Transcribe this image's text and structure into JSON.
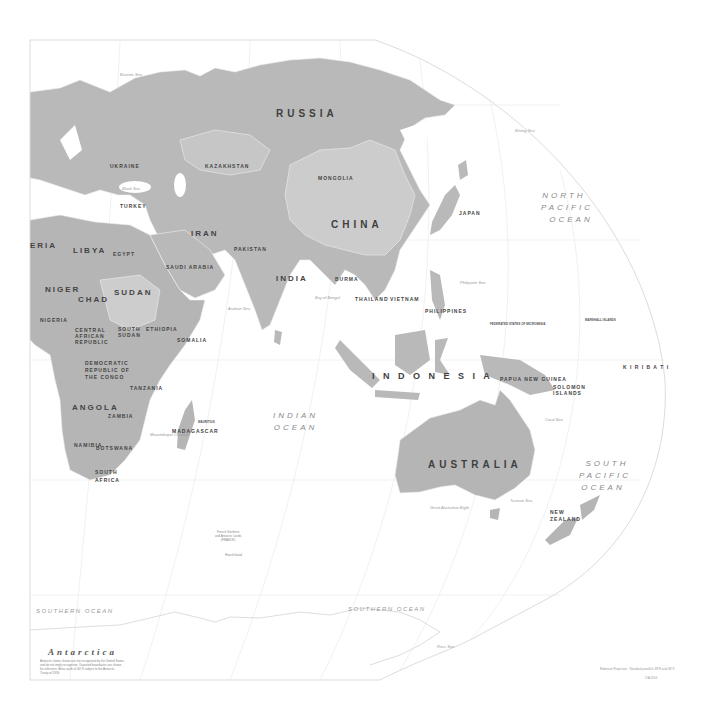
{
  "map": {
    "projection_frame": "world map, Eastern Hemisphere, pacific-centered oval edge",
    "colors": {
      "land": "#b7b7b7",
      "land_alt": "#c9c9c9",
      "land_light": "#d6d6d6",
      "water": "#ffffff",
      "graticule": "#e6e6e6",
      "border": "#ececec",
      "text": "#3a3a3a",
      "ocean_text": "#8a8a8a"
    },
    "countries": {
      "russia": "RUSSIA",
      "kazakhstan": "KAZAKHSTAN",
      "mongolia": "MONGOLIA",
      "china": "CHINA",
      "ukraine": "UKRAINE",
      "turkey": "TURKEY",
      "iran": "IRAN",
      "libya": "LIBYA",
      "egypt": "EGYPT",
      "saudi_arabia": "SAUDI ARABIA",
      "algeria": "ERIA",
      "niger": "NIGER",
      "chad": "CHAD",
      "sudan": "SUDAN",
      "nigeria": "NIGERIA",
      "south_sudan": "SOUTH SUDAN",
      "ethiopia": "ETHIOPIA",
      "somalia": "SOMALIA",
      "car": "CENTRAL AFRICAN REPUBLIC",
      "drc": "DEMOCRATIC REPUBLIC OF THE CONGO",
      "tanzania": "TANZANIA",
      "angola": "ANGOLA",
      "zambia": "ZAMBIA",
      "namibia": "NAMIBIA",
      "botswana": "BOTSWANA",
      "south_africa": "SOUTH AFRICA",
      "madagascar": "MADAGASCAR",
      "india": "INDIA",
      "pakistan": "PAKISTAN",
      "burma": "BURMA",
      "thailand": "THAILAND",
      "vietnam": "VIETNAM",
      "philippines": "PHILIPPINES",
      "indonesia": "I N D O N E S I A",
      "papua_new_guinea": "PAPUA NEW GUINEA",
      "australia": "AUSTRALIA",
      "new_zealand": "NEW ZEALAND",
      "japan": "JAPAN",
      "solomon_islands": "SOLOMON ISLANDS",
      "kiribati": "K I R I B A T I"
    },
    "oceans": {
      "north_pacific": [
        "NORTH",
        "PACIFIC",
        "OCEAN"
      ],
      "south_pacific": [
        "SOUTH",
        "PACIFIC",
        "OCEAN"
      ],
      "indian": [
        "INDIAN",
        "OCEAN"
      ],
      "southern_left": "SOUTHERN OCEAN",
      "southern_right": "SOUTHERN OCEAN"
    },
    "seas": {
      "arabian_sea": "Arabian Sea",
      "bay_of_bengal": "Bay of Bengal",
      "philippine_sea": "Philippine Sea",
      "tasman_sea": "Tasman Sea",
      "black_sea": "Black Sea",
      "barents_sea": "Barents Sea",
      "bering_sea": "Bering Sea",
      "great_australian_bight": "Great Australian Bight",
      "ross_sea": "Ross Sea",
      "coral_sea": "Coral Sea",
      "mozambique_channel": "Mozambique Channel"
    },
    "islands": {
      "french_southern": [
        "French Southern",
        "and Antarctic Lands",
        "(FRANCE)"
      ],
      "heard": "Heard Island",
      "mauritius": "MAURITIUS",
      "micronesia": "FEDERATED STATES OF MICRONESIA",
      "marshall": "MARSHALL ISLANDS"
    },
    "antarctica": {
      "title": "Antarctica",
      "note_lines": [
        "Antarctic claims shown are not recognized by the United States",
        "and do not imply recognition. Disputed boundaries are shown",
        "for reference. Area south of 60°S subject to the Antarctic",
        "Treaty of 1959."
      ]
    },
    "credits": {
      "line1": "Robinson Projection · Standard parallels 38°N and 38°S",
      "line2": "CIA 2016"
    }
  }
}
